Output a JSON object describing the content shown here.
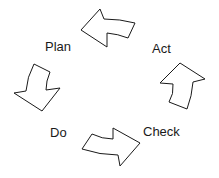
{
  "diagram": {
    "colors": {
      "stroke": "#1a1a1a",
      "fill": "#ffffff",
      "text": "#1a1a1a",
      "background": "#ffffff"
    },
    "labels": {
      "plan": "Plan",
      "act": "Act",
      "do": "Do",
      "check": "Check"
    },
    "arrows": [
      {
        "name": "act-to-plan-arrow",
        "direction": "left"
      },
      {
        "name": "check-to-act-arrow",
        "direction": "up"
      },
      {
        "name": "do-to-check-arrow",
        "direction": "right"
      },
      {
        "name": "plan-to-do-arrow",
        "direction": "down"
      }
    ]
  }
}
